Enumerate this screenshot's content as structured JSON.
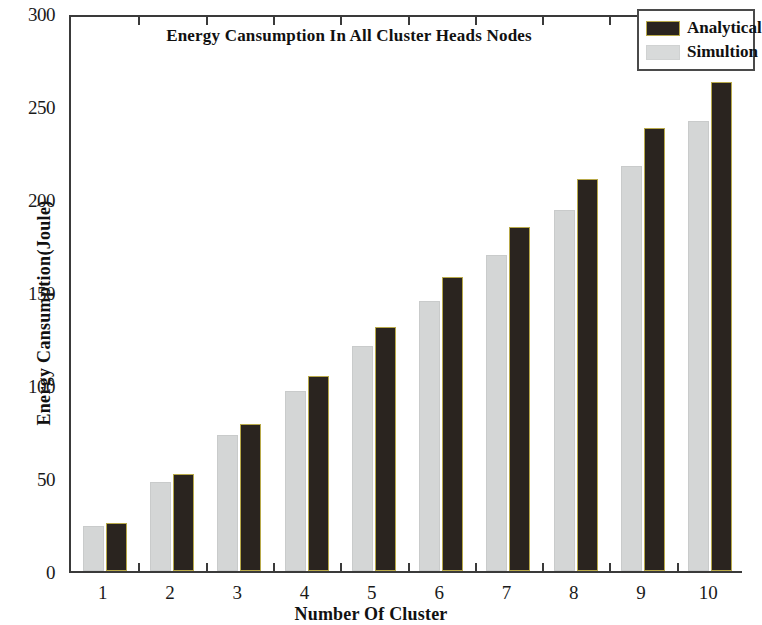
{
  "chart_data": {
    "type": "bar",
    "title": "Energy Cansumption In All Cluster Heads Nodes",
    "xlabel": "Number Of Cluster",
    "ylabel": "Energy Cansumption(Joule)",
    "categories": [
      "1",
      "2",
      "3",
      "4",
      "5",
      "6",
      "7",
      "8",
      "9",
      "10"
    ],
    "series": [
      {
        "name": "Simultion",
        "color": "#d4d6d6",
        "values": [
          24,
          48,
          73,
          97,
          121,
          145,
          170,
          194,
          218,
          242
        ]
      },
      {
        "name": "Analytical",
        "color": "#2a241f",
        "values": [
          26,
          52,
          79,
          105,
          131,
          158,
          185,
          211,
          238,
          263
        ]
      }
    ],
    "ylim": [
      0,
      300
    ],
    "yticks": [
      0,
      50,
      100,
      150,
      200,
      250,
      300
    ],
    "ytick_labels": [
      "0",
      "50",
      "100",
      "150",
      "200",
      "250",
      "300"
    ],
    "xtick_labels": [
      "1",
      "2",
      "3",
      "4",
      "5",
      "6",
      "7",
      "8",
      "9",
      "10"
    ],
    "grid": false,
    "legend_position": "top-right",
    "legend_entries": [
      "Analytical",
      "Simultion"
    ]
  },
  "legend": {
    "analytical_label": "Analytical",
    "simultion_label": "Simultion"
  }
}
